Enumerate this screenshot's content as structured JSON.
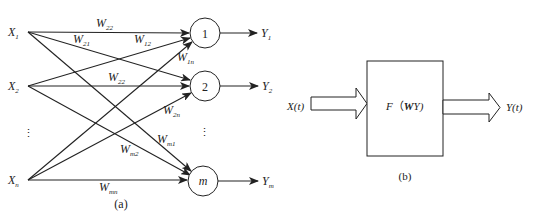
{
  "diagram_a": {
    "caption": "(a)",
    "inputs": [
      {
        "id": "x1",
        "label": "X",
        "sub": "1"
      },
      {
        "id": "x2",
        "label": "X",
        "sub": "2"
      },
      {
        "id": "xn",
        "label": "X",
        "sub": "n"
      }
    ],
    "input_ellipsis": "⋮",
    "neurons": [
      {
        "id": "n1",
        "label": "1"
      },
      {
        "id": "n2",
        "label": "2"
      },
      {
        "id": "nm",
        "label": "m"
      }
    ],
    "neuron_ellipsis": "⋮",
    "outputs": [
      {
        "id": "y1",
        "label": "Y",
        "sub": "1"
      },
      {
        "id": "y2",
        "label": "Y",
        "sub": "2"
      },
      {
        "id": "ym",
        "label": "Y",
        "sub": "m"
      }
    ],
    "weights": [
      {
        "label": "W",
        "sub": "22",
        "note": "X1→1 (as printed)"
      },
      {
        "label": "W",
        "sub": "21"
      },
      {
        "label": "W",
        "sub": "12"
      },
      {
        "label": "W",
        "sub": "1n"
      },
      {
        "label": "W",
        "sub": "22"
      },
      {
        "label": "W",
        "sub": "2n"
      },
      {
        "label": "W",
        "sub": "m1"
      },
      {
        "label": "W",
        "sub": "m2"
      },
      {
        "label": "W",
        "sub": "mn"
      }
    ]
  },
  "diagram_b": {
    "caption": "(b)",
    "input_label": "X(t)",
    "output_label": "Y(t)",
    "block_label_f": "F",
    "block_label_open": "（",
    "block_label_w": "W",
    "block_label_y": "Y)"
  }
}
